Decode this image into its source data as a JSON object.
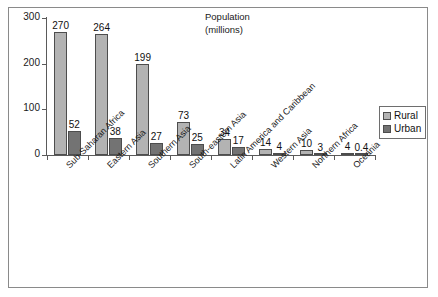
{
  "chart_data": {
    "type": "bar",
    "title": "Population (millions)",
    "title_lines": [
      "Population",
      "(millions)"
    ],
    "xlabel": "",
    "ylabel": "",
    "ylim": [
      0,
      300
    ],
    "yticks": [
      0,
      100,
      200,
      300
    ],
    "ytick_labels": [
      "0",
      "100",
      "200",
      "300"
    ],
    "grid": false,
    "legend_position": "right",
    "categories": [
      "Sub-Saharan Africa",
      "Eastern Asia",
      "Southern Asia",
      "South-eastern Asia",
      "Latin America and Caribbean",
      "Western Asia",
      "Northern Africa",
      "Oceania"
    ],
    "series": [
      {
        "name": "Rural",
        "color": "#b3b3b3",
        "values": [
          270,
          264,
          199,
          73,
          34,
          14,
          10,
          4
        ],
        "value_labels": [
          "270",
          "264",
          "199",
          "73",
          "34",
          "14",
          "10",
          "4"
        ]
      },
      {
        "name": "Urban",
        "color": "#737373",
        "values": [
          52,
          38,
          27,
          25,
          17,
          4,
          3,
          0.4
        ],
        "value_labels": [
          "52",
          "38",
          "27",
          "25",
          "17",
          "4",
          "3",
          "0.4"
        ]
      }
    ]
  },
  "legend": {
    "items": [
      {
        "label": "Rural",
        "color": "#b3b3b3"
      },
      {
        "label": "Urban",
        "color": "#737373"
      }
    ]
  },
  "colors": {
    "rural": "#b3b3b3",
    "urban": "#737373",
    "axis": "#5a5a5a",
    "frame": "#8a8a8a",
    "text": "#1a1a1a"
  }
}
